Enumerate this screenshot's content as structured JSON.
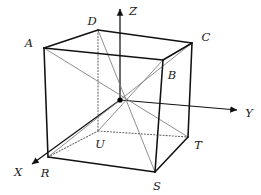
{
  "figure": {
    "type": "geometric-diagram",
    "background_color": "#ffffff",
    "stroke_color": "#111111",
    "hidden_stroke_color": "#666666",
    "diagonal_stroke_color": "#7a7a7a"
  },
  "geometry": {
    "center": {
      "label": "",
      "x": 120,
      "y": 100
    },
    "vertices": [
      {
        "id": "A",
        "label": "A",
        "x": 44,
        "y": 48,
        "label_x": 29,
        "label_y": 44,
        "hidden": false,
        "face": "top"
      },
      {
        "id": "D",
        "label": "D",
        "x": 98,
        "y": 30,
        "label_x": 92,
        "label_y": 22,
        "hidden": false,
        "face": "top"
      },
      {
        "id": "C",
        "label": "C",
        "x": 192,
        "y": 43,
        "label_x": 206,
        "label_y": 38,
        "hidden": false,
        "face": "top"
      },
      {
        "id": "B",
        "label": "B",
        "x": 163,
        "y": 60,
        "label_x": 172,
        "label_y": 76,
        "hidden": false,
        "face": "top"
      },
      {
        "id": "R",
        "label": "R",
        "x": 48,
        "y": 157,
        "label_x": 45,
        "label_y": 174,
        "hidden": false,
        "face": "bottom"
      },
      {
        "id": "U",
        "label": "U",
        "x": 98,
        "y": 131,
        "label_x": 100,
        "label_y": 145,
        "hidden": true,
        "face": "bottom"
      },
      {
        "id": "T",
        "label": "T",
        "x": 188,
        "y": 137,
        "label_x": 198,
        "label_y": 146,
        "hidden": false,
        "face": "bottom"
      },
      {
        "id": "S",
        "label": "S",
        "x": 155,
        "y": 172,
        "label_x": 157,
        "label_y": 187,
        "hidden": false,
        "face": "bottom"
      }
    ],
    "edges_solid": [
      {
        "from": "A",
        "to": "D"
      },
      {
        "from": "D",
        "to": "C"
      },
      {
        "from": "C",
        "to": "B"
      },
      {
        "from": "B",
        "to": "A"
      },
      {
        "from": "A",
        "to": "R"
      },
      {
        "from": "B",
        "to": "S"
      },
      {
        "from": "C",
        "to": "T"
      },
      {
        "from": "R",
        "to": "S"
      },
      {
        "from": "S",
        "to": "T"
      }
    ],
    "edges_hidden": [
      {
        "from": "D",
        "to": "U"
      },
      {
        "from": "R",
        "to": "U"
      },
      {
        "from": "U",
        "to": "T"
      }
    ],
    "diagonals": [
      {
        "from": "A",
        "to": "T"
      },
      {
        "from": "C",
        "to": "R"
      },
      {
        "from": "D",
        "to": "S"
      },
      {
        "from": "B",
        "to": "U"
      }
    ]
  },
  "axes": [
    {
      "id": "Z",
      "label": "Z",
      "from_x": 120,
      "from_y": 100,
      "tip_x": 120,
      "tip_y": 9,
      "label_x": 133,
      "label_y": 12
    },
    {
      "id": "Y",
      "label": "Y",
      "from_x": 120,
      "from_y": 100,
      "tip_x": 237,
      "tip_y": 110,
      "label_x": 249,
      "label_y": 114
    },
    {
      "id": "X",
      "label": "X",
      "from_x": 120,
      "from_y": 100,
      "tip_x": 32,
      "tip_y": 164,
      "label_x": 18,
      "label_y": 173
    }
  ]
}
